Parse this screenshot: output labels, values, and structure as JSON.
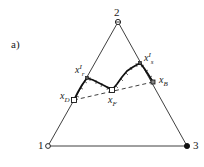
{
  "panel_label": "a)",
  "vertices": {
    "v1": {
      "label": "1",
      "marker": "open-circle"
    },
    "v2": {
      "label": "2",
      "marker": "circle-with-cross"
    },
    "v3": {
      "label": "3",
      "marker": "filled-circle"
    }
  },
  "points": {
    "xD": {
      "base": "x",
      "sub": "D"
    },
    "xF": {
      "base": "x",
      "sub": "F"
    },
    "xB": {
      "base": "x",
      "sub": "B"
    },
    "xr": {
      "base": "x",
      "sup": "I",
      "sub": "r"
    },
    "xs": {
      "base": "x",
      "sup": "I",
      "sub": "s"
    }
  },
  "lines": {
    "profile": "solid thick column profile xD → x'r → xF → x's → xB",
    "mass_balance": "dashed line xD — xB"
  },
  "colors": {
    "stroke": "#1a1a1a",
    "background": "#ffffff"
  }
}
